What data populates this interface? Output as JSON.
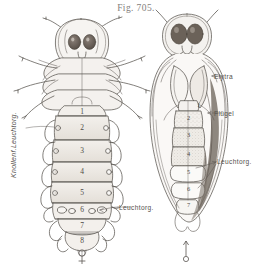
{
  "figure": {
    "title": "Fig. 705.",
    "caption_labels": {
      "elytra": "Elytra",
      "fluegel": "Flügel",
      "leuchtorg_right": "Leuchtorg.",
      "leuchtorg_left": "Leuchtorg.",
      "knollen_leuchtorg": "Knollenf.Leuchtorg."
    },
    "symbols": {
      "female": "♀",
      "male": "♂"
    },
    "colors": {
      "ink": "#4e4a46",
      "paper": "#ffffff",
      "wash": "#ece8e2",
      "eye_dark": "#6b6259",
      "shadow": "#bdb7ae"
    }
  },
  "left_figure": {
    "name": "female-larviform-beetle-dorsal",
    "sex": "♀",
    "segment_numbers": [
      "1",
      "2",
      "3",
      "4",
      "5",
      "6",
      "7",
      "8"
    ],
    "annotations": [
      "Knollenf.Leuchtorg.",
      "Leuchtorg."
    ]
  },
  "right_figure": {
    "name": "male-beetle-dorsal",
    "sex": "♂",
    "segment_numbers": [
      "1",
      "2",
      "3",
      "4",
      "5",
      "6",
      "7"
    ],
    "annotations": [
      "Elytra",
      "Flügel",
      "Leuchtorg."
    ]
  }
}
